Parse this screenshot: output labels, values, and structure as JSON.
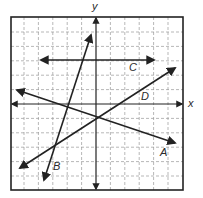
{
  "diagram": {
    "title": "",
    "type": "coordinate-plane-lines",
    "colors": {
      "line": "#222222",
      "grid": "#9a9a9a",
      "frame": "#222222",
      "background": "#ffffff"
    },
    "frame": {
      "x": 11,
      "y": 17,
      "width": 172,
      "height": 173
    },
    "grid": {
      "origin_px": [
        96,
        104
      ],
      "step_px": 14.4,
      "x_range": [
        -6,
        6
      ],
      "y_range": [
        -6,
        6
      ],
      "style": "dashed"
    },
    "axes": {
      "x_label": "x",
      "y_label": "y",
      "x_axis": {
        "x1": 12,
        "y1": 104,
        "x2": 182,
        "y2": 104
      },
      "y_axis": {
        "x1": 96,
        "y1": 18,
        "x2": 96,
        "y2": 189
      }
    },
    "lines": [
      {
        "label": "A",
        "x1": 17,
        "y1": 90,
        "x2": 175,
        "y2": 143,
        "label_pos": [
          160,
          147
        ]
      },
      {
        "label": "B",
        "x1": 44,
        "y1": 180,
        "x2": 91,
        "y2": 35,
        "label_pos": [
          53,
          161
        ]
      },
      {
        "label": "C",
        "x1": 41,
        "y1": 60,
        "x2": 154,
        "y2": 60,
        "label_pos": [
          129,
          62
        ]
      },
      {
        "label": "D",
        "x1": 20,
        "y1": 168,
        "x2": 175,
        "y2": 68,
        "label_pos": [
          141,
          91
        ]
      }
    ]
  },
  "labels": {
    "x": "x",
    "y": "y",
    "A": "A",
    "B": "B",
    "C": "C",
    "D": "D"
  }
}
